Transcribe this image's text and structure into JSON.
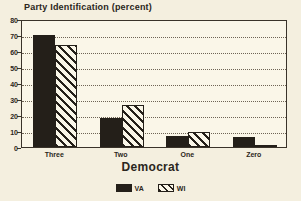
{
  "chart_data": {
    "type": "bar",
    "title": "Party Identification (percent)",
    "xlabel": "Democrat",
    "ylabel": "",
    "categories": [
      "Three",
      "Two",
      "One",
      "Zero"
    ],
    "series": [
      {
        "name": "VA",
        "fill": "solid",
        "color": "#241f19",
        "values": [
          70,
          18,
          7,
          6
        ]
      },
      {
        "name": "WI",
        "fill": "hatched",
        "color": "#241f19",
        "values": [
          64,
          26,
          9.5,
          0.5
        ]
      }
    ],
    "ylim": [
      0,
      80
    ],
    "yticks": [
      0,
      10,
      20,
      30,
      40,
      50,
      60,
      70,
      80
    ],
    "ytick_labels": [
      "0",
      "10",
      "20",
      "30",
      "40",
      "50",
      "60",
      "70",
      "80"
    ],
    "grid": true,
    "grid_style": "dotted",
    "legend_position": "bottom",
    "background": "#faf6e8",
    "page_background": "#f4efdf"
  }
}
